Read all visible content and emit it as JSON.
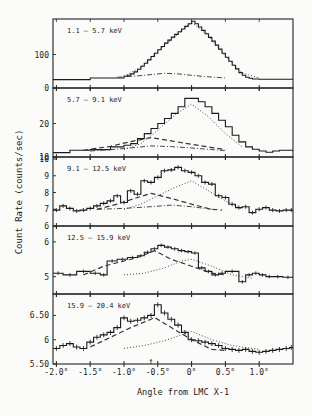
{
  "chart_data": {
    "type": "line",
    "ylabel": "Count Rate (counts/sec)",
    "xlabel": "Angle from LMC X-1",
    "x_ticks": [
      -2.0,
      -1.5,
      -1.0,
      -0.5,
      0,
      0.5,
      1.0
    ],
    "x_tick_labels": [
      "-2.0°",
      "-1.5°",
      "-1.0°",
      "-0.5°",
      "0°",
      "0.5°",
      "1.0°"
    ],
    "xlim": [
      -2.05,
      1.5
    ],
    "arrow_marker_x": -0.6,
    "legend_position": "none",
    "grid": false,
    "panels": [
      {
        "label": "1.1 –  5.7 keV",
        "ylim": [
          0,
          200
        ],
        "y_ticks": [
          0,
          100
        ],
        "y_tick_labels": [
          "0",
          "100"
        ],
        "series": [
          {
            "name": "data histogram",
            "style": "step",
            "x": [
              -2.05,
              -1.5,
              -1.0,
              -0.95,
              -0.9,
              -0.85,
              -0.8,
              -0.75,
              -0.7,
              -0.65,
              -0.6,
              -0.55,
              -0.5,
              -0.45,
              -0.4,
              -0.35,
              -0.3,
              -0.25,
              -0.2,
              -0.15,
              -0.1,
              -0.05,
              0,
              0.05,
              0.1,
              0.15,
              0.2,
              0.25,
              0.3,
              0.35,
              0.4,
              0.45,
              0.5,
              0.55,
              0.6,
              0.65,
              0.7,
              0.75,
              0.8,
              0.85,
              0.9,
              1.0,
              1.5
            ],
            "y": [
              25,
              30,
              35,
              38,
              42,
              48,
              56,
              65,
              74,
              84,
              94,
              104,
              114,
              124,
              134,
              143,
              152,
              160,
              168,
              176,
              184,
              192,
              199,
              192,
              182,
              172,
              162,
              151,
              140,
              128,
              116,
              104,
              92,
              80,
              68,
              57,
              46,
              38,
              32,
              29,
              27,
              26,
              26
            ]
          },
          {
            "name": "model (dotted)",
            "style": "dotted",
            "x": [
              -1.0,
              -0.75,
              -0.5,
              -0.25,
              0,
              0.25,
              0.5,
              0.75,
              1.0
            ],
            "y": [
              35,
              62,
              110,
              152,
              196,
              155,
              95,
              45,
              30
            ]
          },
          {
            "name": "confusing source (dash-dot)",
            "style": "dashdot",
            "x": [
              -1.1,
              -0.8,
              -0.6,
              -0.4,
              -0.2,
              0,
              0.2,
              0.5
            ],
            "y": [
              32,
              36,
              40,
              44,
              42,
              38,
              34,
              30
            ]
          }
        ]
      },
      {
        "label": "5.7 – 9.1 keV",
        "ylim": [
          10,
          30
        ],
        "y_ticks": [
          10,
          20
        ],
        "y_tick_labels": [
          "10",
          "20"
        ],
        "series": [
          {
            "name": "data histogram",
            "style": "step",
            "x": [
              -2.05,
              -1.8,
              -1.5,
              -1.2,
              -1.0,
              -0.9,
              -0.8,
              -0.7,
              -0.6,
              -0.5,
              -0.4,
              -0.3,
              -0.2,
              -0.1,
              0,
              0.1,
              0.2,
              0.3,
              0.4,
              0.5,
              0.6,
              0.7,
              0.8,
              0.9,
              1.0,
              1.1,
              1.2,
              1.3,
              1.5
            ],
            "y": [
              11.3,
              12.0,
              12.2,
              13.0,
              13.5,
              14.0,
              15.5,
              17.0,
              18.5,
              20.0,
              21.5,
              23.0,
              25.0,
              27.5,
              27.5,
              26.5,
              25.0,
              23.0,
              21.0,
              19.0,
              16.5,
              14.5,
              13.0,
              12.3,
              11.8,
              11.4,
              11.8,
              12.0,
              11.6
            ]
          },
          {
            "name": "model (dotted)",
            "style": "dotted",
            "x": [
              -1.0,
              -0.75,
              -0.5,
              -0.25,
              0,
              0.25,
              0.5,
              0.75
            ],
            "y": [
              12.2,
              14.0,
              18.0,
              22.5,
              25.8,
              22.0,
              17.0,
              13.0
            ]
          },
          {
            "name": "model (dashed)",
            "style": "dashed",
            "x": [
              -1.6,
              -1.2,
              -0.9,
              -0.6,
              -0.3,
              0,
              0.3,
              0.5
            ],
            "y": [
              12.0,
              13.2,
              14.6,
              15.8,
              14.8,
              13.8,
              12.8,
              12.2
            ]
          },
          {
            "name": "model (dash-dot)",
            "style": "dashdot",
            "x": [
              -1.5,
              -1.2,
              -0.9,
              -0.6,
              -0.3,
              0,
              0.3,
              0.5
            ],
            "y": [
              11.8,
              12.2,
              12.7,
              13.3,
              13.1,
              12.7,
              12.2,
              11.9
            ]
          }
        ]
      },
      {
        "label": "9.1 – 12.5 keV",
        "ylim": [
          6,
          10
        ],
        "y_ticks": [
          6,
          7,
          8,
          9,
          10
        ],
        "y_tick_labels": [
          "6",
          "7",
          "8",
          "9",
          "10"
        ],
        "series": [
          {
            "name": "data histogram with error bars",
            "style": "step-errorbar",
            "x": [
              -2.05,
              -1.95,
              -1.85,
              -1.75,
              -1.65,
              -1.55,
              -1.45,
              -1.35,
              -1.25,
              -1.15,
              -1.05,
              -0.95,
              -0.85,
              -0.75,
              -0.65,
              -0.55,
              -0.45,
              -0.35,
              -0.25,
              -0.15,
              -0.05,
              0.05,
              0.15,
              0.25,
              0.35,
              0.45,
              0.55,
              0.65,
              0.75,
              0.85,
              0.95,
              1.05,
              1.15,
              1.25,
              1.35,
              1.45
            ],
            "y": [
              6.95,
              7.2,
              7.05,
              6.9,
              6.95,
              7.05,
              7.2,
              7.35,
              7.5,
              7.8,
              7.4,
              8.1,
              7.9,
              8.7,
              8.6,
              8.9,
              9.3,
              9.35,
              9.5,
              9.3,
              9.2,
              9.0,
              8.6,
              8.5,
              7.8,
              7.7,
              7.3,
              7.1,
              7.15,
              6.8,
              7.0,
              7.1,
              6.95,
              6.9,
              6.95,
              6.95
            ],
            "yerr": 0.12
          },
          {
            "name": "model (dotted)",
            "style": "dotted",
            "x": [
              -1.0,
              -0.75,
              -0.5,
              -0.25,
              0,
              0.25,
              0.5,
              0.75
            ],
            "y": [
              7.0,
              7.3,
              7.8,
              8.3,
              8.7,
              8.1,
              7.5,
              7.0
            ]
          },
          {
            "name": "model (dashed)",
            "style": "dashed",
            "x": [
              -1.4,
              -1.1,
              -0.8,
              -0.6,
              -0.3,
              0,
              0.3,
              0.45
            ],
            "y": [
              7.0,
              7.3,
              7.7,
              7.95,
              7.65,
              7.3,
              7.0,
              6.95
            ]
          },
          {
            "name": "model (dash-dot)",
            "style": "dashdot",
            "x": [
              -1.4,
              -1.0,
              -0.6,
              -0.3,
              0,
              0.3
            ],
            "y": [
              7.0,
              7.05,
              7.15,
              7.25,
              7.15,
              7.0
            ]
          }
        ]
      },
      {
        "label": "12.5 – 15.9 keV",
        "ylim": [
          4.5,
          6.4
        ],
        "y_ticks": [
          5,
          6
        ],
        "y_tick_labels": [
          "5",
          "6"
        ],
        "series": [
          {
            "name": "data histogram with error bars",
            "style": "step-errorbar",
            "x": [
              -2.05,
              -1.9,
              -1.7,
              -1.5,
              -1.35,
              -1.25,
              -1.1,
              -0.95,
              -0.8,
              -0.7,
              -0.6,
              -0.5,
              -0.4,
              -0.3,
              -0.2,
              -0.1,
              0,
              0.1,
              0.2,
              0.3,
              0.4,
              0.5,
              0.7,
              0.8,
              0.9,
              1.0,
              1.1,
              1.2,
              1.35
            ],
            "y": [
              5.1,
              5.05,
              5.15,
              5.1,
              5.05,
              5.45,
              5.5,
              5.55,
              5.6,
              5.7,
              5.8,
              5.9,
              5.85,
              5.8,
              5.75,
              5.72,
              5.68,
              5.25,
              5.15,
              5.05,
              5.1,
              5.15,
              4.85,
              5.05,
              5.1,
              5.05,
              5.0,
              5.0,
              4.98
            ],
            "yerr": 0.05
          },
          {
            "name": "model (dotted)",
            "style": "dotted",
            "x": [
              -1.0,
              -0.7,
              -0.4,
              -0.15,
              0,
              0.3,
              0.6,
              0.9
            ],
            "y": [
              5.05,
              5.1,
              5.25,
              5.45,
              5.5,
              5.3,
              5.05,
              4.95
            ]
          },
          {
            "name": "model (dashed)",
            "style": "dashed",
            "x": [
              -1.6,
              -1.3,
              -1.0,
              -0.8,
              -0.55,
              -0.3,
              0,
              0.3,
              0.5
            ],
            "y": [
              5.05,
              5.3,
              5.45,
              5.55,
              5.75,
              5.5,
              5.3,
              5.1,
              5.05
            ]
          }
        ]
      },
      {
        "label": "15.9 – 20.4 keV",
        "ylim": [
          5.5,
          6.9
        ],
        "y_ticks": [
          5.5,
          6,
          6.5
        ],
        "y_tick_labels": [
          "5.50",
          "6",
          "6.50"
        ],
        "series": [
          {
            "name": "data histogram with error bars",
            "style": "step-errorbar",
            "x": [
              -2.05,
              -1.95,
              -1.85,
              -1.75,
              -1.65,
              -1.55,
              -1.45,
              -1.35,
              -1.25,
              -1.15,
              -1.05,
              -0.95,
              -0.85,
              -0.75,
              -0.65,
              -0.55,
              -0.45,
              -0.35,
              -0.25,
              -0.15,
              -0.05,
              0.05,
              0.15,
              0.25,
              0.35,
              0.45,
              0.55,
              0.65,
              0.75,
              0.85,
              0.95,
              1.05,
              1.15,
              1.25,
              1.35,
              1.45
            ],
            "y": [
              5.82,
              5.88,
              5.92,
              5.85,
              5.82,
              5.95,
              6.05,
              6.1,
              6.15,
              6.25,
              6.45,
              6.38,
              6.4,
              6.45,
              6.5,
              6.72,
              6.55,
              6.42,
              6.3,
              6.15,
              6.0,
              5.98,
              5.95,
              5.92,
              5.88,
              5.82,
              5.8,
              5.78,
              5.8,
              5.76,
              5.74,
              5.76,
              5.78,
              5.8,
              5.82,
              5.84
            ],
            "yerr": 0.05
          },
          {
            "name": "model (dotted)",
            "style": "dotted",
            "x": [
              -1.0,
              -0.7,
              -0.4,
              -0.15,
              0,
              0.3,
              0.6,
              1.0
            ],
            "y": [
              5.82,
              5.88,
              5.98,
              6.1,
              6.17,
              6.0,
              5.88,
              5.8
            ]
          },
          {
            "name": "model (dashed)",
            "style": "dashed",
            "x": [
              -1.5,
              -1.2,
              -0.9,
              -0.6,
              -0.55,
              -0.3,
              0,
              0.3,
              0.5
            ],
            "y": [
              5.85,
              6.05,
              6.25,
              6.42,
              6.46,
              6.25,
              6.0,
              5.8,
              5.78
            ]
          }
        ]
      }
    ]
  },
  "annotations": {
    "arrow_label": "↑"
  }
}
